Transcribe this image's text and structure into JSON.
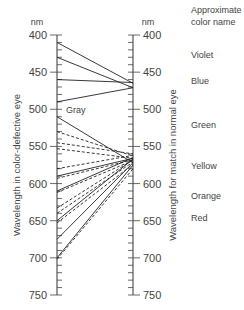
{
  "left_axis": {
    "unit": "nm",
    "title": "Wavelength in color-defective eye",
    "ticks": [
      "400",
      "450",
      "500",
      "550",
      "600",
      "650",
      "700",
      "750"
    ]
  },
  "right_axis": {
    "unit": "nm",
    "title": "Wavelength for match in normal eye",
    "ticks": [
      "400",
      "450",
      "500",
      "550",
      "600",
      "650",
      "700",
      "750"
    ]
  },
  "gray_label": "Gray",
  "color_names": {
    "header_line1": "Approximate",
    "header_line2": "color name",
    "items": [
      {
        "name": "Violet",
        "nm": 425
      },
      {
        "name": "Blue",
        "nm": 460
      },
      {
        "name": "Green",
        "nm": 520
      },
      {
        "name": "Yellow",
        "nm": 575
      },
      {
        "name": "Orange",
        "nm": 615
      },
      {
        "name": "Red",
        "nm": 645
      }
    ]
  },
  "mappings": [
    {
      "from": 410,
      "to": 465,
      "style": "solid"
    },
    {
      "from": 430,
      "to": 471,
      "style": "solid"
    },
    {
      "from": 460,
      "to": 464,
      "style": "solid"
    },
    {
      "from": 490,
      "to": 471,
      "style": "solid"
    },
    {
      "from": 510,
      "to": 572,
      "style": "solid"
    },
    {
      "from": 530,
      "to": 563,
      "style": "dashed"
    },
    {
      "from": 545,
      "to": 560,
      "style": "dashed"
    },
    {
      "from": 553,
      "to": 566,
      "style": "dashed"
    },
    {
      "from": 580,
      "to": 562,
      "style": "dashed"
    },
    {
      "from": 590,
      "to": 566,
      "style": "solid"
    },
    {
      "from": 593,
      "to": 568,
      "style": "dashed"
    },
    {
      "from": 610,
      "to": 565,
      "style": "solid"
    },
    {
      "from": 612,
      "to": 569,
      "style": "dashed"
    },
    {
      "from": 633,
      "to": 568,
      "style": "dashed"
    },
    {
      "from": 640,
      "to": 571,
      "style": "dashed"
    },
    {
      "from": 650,
      "to": 567,
      "style": "solid"
    },
    {
      "from": 653,
      "to": 574,
      "style": "dashed"
    },
    {
      "from": 675,
      "to": 572,
      "style": "solid"
    },
    {
      "from": 700,
      "to": 575,
      "style": "solid"
    },
    {
      "from": 702,
      "to": 580,
      "style": "dashed"
    }
  ]
}
